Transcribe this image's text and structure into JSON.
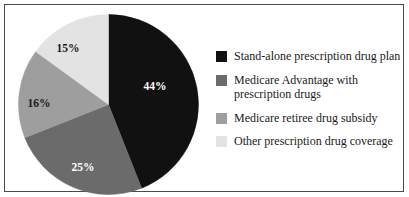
{
  "frame": {
    "border_color": "#4a4a4a",
    "background": "#ffffff"
  },
  "chart_data": {
    "type": "pie",
    "title": "",
    "subtitle": "",
    "xlabel": "",
    "ylabel": "",
    "grid": false,
    "legend_position": "right",
    "start_angle_deg": 0,
    "direction": "clockwise",
    "categories": [
      "Stand-alone prescription drug plan",
      "Medicare Advantage with prescription drugs",
      "Medicare retiree drug subsidy",
      "Other prescription drug coverage"
    ],
    "values": [
      44,
      25,
      16,
      15
    ],
    "value_labels": [
      "44%",
      "25%",
      "16%",
      "15%"
    ],
    "colors": [
      "#111111",
      "#6b6b6b",
      "#9e9e9e",
      "#e3e3e3"
    ],
    "label_colors": [
      "#ffffff",
      "#ffffff",
      "#1a1a1a",
      "#1a1a1a"
    ],
    "units": "percent"
  },
  "pie": {
    "center_x": 90.5,
    "center_y": 90.5,
    "radius": 90,
    "slices": [
      {
        "name": "Stand-alone prescription drug plan",
        "percent": 44,
        "label": "44%",
        "fill": "#111111",
        "label_fill": "#ffffff",
        "label_x": 137,
        "label_y": 76
      },
      {
        "name": "Medicare Advantage with prescription drugs",
        "percent": 25,
        "label": "25%",
        "fill": "#6b6b6b",
        "label_fill": "#ffffff",
        "label_x": 65,
        "label_y": 157
      },
      {
        "name": "Medicare retiree drug subsidy",
        "percent": 16,
        "label": "16%",
        "fill": "#9e9e9e",
        "label_fill": "#1a1a1a",
        "label_x": 21,
        "label_y": 93
      },
      {
        "name": "Other prescription drug coverage",
        "percent": 15,
        "label": "15%",
        "fill": "#e3e3e3",
        "label_fill": "#1a1a1a",
        "label_x": 50,
        "label_y": 38
      }
    ]
  },
  "legend": {
    "items": [
      {
        "label": "Stand-alone prescription drug plan",
        "color": "#111111",
        "swatch_name": "legend-swatch-stand-alone"
      },
      {
        "label": "Medicare Advantage with\nprescription drugs",
        "color": "#6b6b6b",
        "swatch_name": "legend-swatch-medicare-advantage"
      },
      {
        "label": "Medicare retiree drug subsidy",
        "color": "#9e9e9e",
        "swatch_name": "legend-swatch-retiree-subsidy"
      },
      {
        "label": "Other prescription drug coverage",
        "color": "#e3e3e3",
        "swatch_name": "legend-swatch-other-coverage"
      }
    ]
  }
}
